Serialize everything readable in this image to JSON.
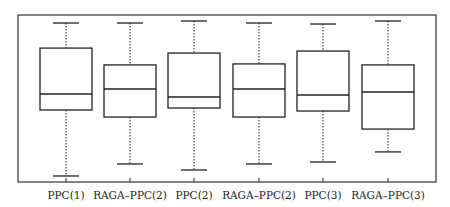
{
  "chart_data": {
    "type": "boxplot",
    "title": "",
    "xlabel": "",
    "ylabel": "",
    "ylim": [
      0,
      100
    ],
    "y_axis_note": "no y-axis ticks shown; values normalized to plot frame (0=bottom, 100=top)",
    "grid": false,
    "legend": null,
    "categories": [
      "PPC(1)",
      "RAGA–PPC(2)",
      "PPC(2)",
      "RAGA–PPC(2)",
      "PPC(3)",
      "RAGA–PPC(3)"
    ],
    "series": [
      {
        "name": "PPC(1)",
        "whisker_low": 3.6,
        "q1": 43.1,
        "median": 52.7,
        "q3": 80.2,
        "whisker_high": 95.2
      },
      {
        "name": "RAGA–PPC(2)",
        "whisker_low": 10.8,
        "q1": 38.9,
        "median": 55.7,
        "q3": 70.1,
        "whisker_high": 95.2
      },
      {
        "name": "PPC(2)",
        "whisker_low": 7.2,
        "q1": 44.3,
        "median": 50.9,
        "q3": 77.2,
        "whisker_high": 96.4
      },
      {
        "name": "RAGA–PPC(2)",
        "whisker_low": 10.8,
        "q1": 38.9,
        "median": 55.7,
        "q3": 70.7,
        "whisker_high": 95.2
      },
      {
        "name": "PPC(3)",
        "whisker_low": 12.0,
        "q1": 42.5,
        "median": 52.1,
        "q3": 78.4,
        "whisker_high": 94.6
      },
      {
        "name": "RAGA–PPC(3)",
        "whisker_low": 18.0,
        "q1": 31.7,
        "median": 53.9,
        "q3": 70.1,
        "whisker_high": 96.4
      }
    ]
  },
  "layout": {
    "frame": {
      "x0": 18,
      "y0": 15,
      "x1": 436,
      "y1": 182
    },
    "centers": [
      66,
      130,
      194,
      259,
      323,
      388
    ],
    "box_half_width": 26,
    "cap_half_width": 13,
    "colors": {
      "line": "#222222",
      "background": "#ffffff"
    }
  }
}
